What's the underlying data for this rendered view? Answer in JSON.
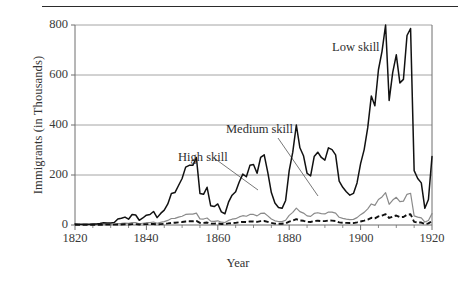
{
  "figure": {
    "ylabel": "Immigrants (in Thousands)",
    "xlabel": "Year",
    "rule": "horizontal-rule"
  },
  "annotations": {
    "low": "Low skill",
    "medium": "Medium skill",
    "high": "High skill"
  },
  "ticks": {
    "y": [
      "800",
      "600",
      "400",
      "200",
      "0"
    ],
    "x": [
      "1820",
      "1840",
      "1860",
      "1880",
      "1900",
      "1920"
    ]
  },
  "colors": {
    "low_skill": "#111111",
    "medium_skill": "#8a8a8a",
    "high_skill": "#111111",
    "grid": "#9a9a9a",
    "axis": "#6f6f6f",
    "text": "#3a3a3a"
  },
  "chart_data": {
    "type": "line",
    "title": "",
    "xlabel": "Year",
    "ylabel": "Immigrants (in Thousands)",
    "xlim": [
      1820,
      1920
    ],
    "ylim": [
      0,
      800
    ],
    "yticks": [
      0,
      200,
      400,
      600,
      800
    ],
    "xticks": [
      1820,
      1840,
      1860,
      1880,
      1900,
      1920
    ],
    "grid": "horizontal",
    "legend": "inline-annotations",
    "x": [
      1820,
      1821,
      1822,
      1823,
      1824,
      1825,
      1826,
      1827,
      1828,
      1829,
      1830,
      1831,
      1832,
      1833,
      1834,
      1835,
      1836,
      1837,
      1838,
      1839,
      1840,
      1841,
      1842,
      1843,
      1844,
      1845,
      1846,
      1847,
      1848,
      1849,
      1850,
      1851,
      1852,
      1853,
      1854,
      1855,
      1856,
      1857,
      1858,
      1859,
      1860,
      1861,
      1862,
      1863,
      1864,
      1865,
      1866,
      1867,
      1868,
      1869,
      1870,
      1871,
      1872,
      1873,
      1874,
      1875,
      1876,
      1877,
      1878,
      1879,
      1880,
      1881,
      1882,
      1883,
      1884,
      1885,
      1886,
      1887,
      1888,
      1889,
      1890,
      1891,
      1892,
      1893,
      1894,
      1895,
      1896,
      1897,
      1898,
      1899,
      1900,
      1901,
      1902,
      1903,
      1904,
      1905,
      1906,
      1907,
      1908,
      1909,
      1910,
      1911,
      1912,
      1913,
      1914,
      1915,
      1916,
      1917,
      1918,
      1919,
      1920
    ],
    "series": [
      {
        "name": "Low skill",
        "style": "solid-thick-black",
        "color": "#111111",
        "values": [
          5,
          4,
          4,
          4,
          4,
          5,
          6,
          8,
          13,
          11,
          12,
          14,
          34,
          38,
          45,
          33,
          60,
          57,
          27,
          40,
          56,
          60,
          77,
          42,
          66,
          85,
          120,
          180,
          185,
          225,
          265,
          330,
          340,
          340,
          385,
          180,
          175,
          215,
          110,
          105,
          120,
          75,
          64,
          130,
          170,
          190,
          245,
          290,
          275,
          340,
          345,
          295,
          385,
          400,
          300,
          185,
          125,
          100,
          95,
          140,
          310,
          415,
          570,
          440,
          395,
          295,
          280,
          390,
          415,
          385,
          370,
          440,
          430,
          400,
          250,
          215,
          190,
          170,
          180,
          240,
          350,
          430,
          555,
          735,
          680,
          885,
          990,
          1140,
          710,
          870,
          970,
          810,
          830,
          1080,
          1120,
          310,
          265,
          240,
          95,
          145,
          390
        ]
      },
      {
        "name": "Medium skill",
        "style": "solid-thin-gray",
        "color": "#8a8a8a",
        "values": [
          2,
          2,
          2,
          2,
          2,
          2,
          3,
          3,
          4,
          4,
          4,
          5,
          8,
          9,
          11,
          9,
          14,
          14,
          7,
          10,
          13,
          14,
          17,
          10,
          15,
          19,
          26,
          37,
          38,
          45,
          50,
          60,
          62,
          62,
          68,
          35,
          34,
          40,
          22,
          21,
          24,
          16,
          14,
          26,
          33,
          36,
          46,
          53,
          50,
          60,
          60,
          52,
          66,
          68,
          52,
          34,
          24,
          20,
          19,
          27,
          55,
          72,
          96,
          76,
          68,
          52,
          49,
          66,
          70,
          65,
          63,
          74,
          73,
          68,
          44,
          38,
          34,
          31,
          32,
          42,
          59,
          72,
          92,
          120,
          112,
          145,
          160,
          184,
          118,
          142,
          158,
          133,
          136,
          175,
          181,
          52,
          45,
          41,
          17,
          26,
          65
        ]
      },
      {
        "name": "High skill",
        "style": "dashed-black",
        "color": "#111111",
        "values": [
          1,
          1,
          1,
          1,
          1,
          1,
          1,
          1,
          2,
          2,
          2,
          2,
          3,
          3,
          4,
          3,
          5,
          5,
          3,
          4,
          5,
          5,
          6,
          4,
          5,
          7,
          9,
          12,
          13,
          15,
          17,
          20,
          21,
          21,
          23,
          12,
          12,
          14,
          8,
          8,
          9,
          6,
          5,
          9,
          11,
          12,
          16,
          18,
          17,
          20,
          20,
          18,
          22,
          23,
          18,
          12,
          8,
          7,
          7,
          10,
          19,
          25,
          33,
          26,
          24,
          18,
          17,
          23,
          24,
          22,
          22,
          26,
          25,
          23,
          15,
          13,
          12,
          11,
          11,
          15,
          20,
          25,
          31,
          41,
          38,
          49,
          54,
          62,
          40,
          48,
          54,
          45,
          46,
          59,
          61,
          18,
          15,
          14,
          6,
          9,
          22
        ]
      }
    ]
  }
}
